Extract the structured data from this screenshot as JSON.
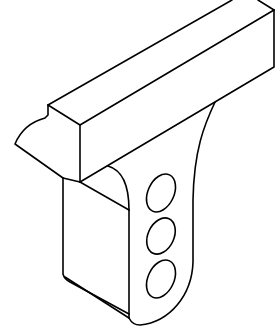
{
  "figure": {
    "title": "Isometric line drawing of a bracket with rectangular bar and three holes",
    "stroke_color": "#000000",
    "background_color": "#ffffff",
    "components": [
      {
        "name": "rectangular-bar",
        "description": "Long rectangular bar running diagonally from lower-left to upper-right"
      },
      {
        "name": "wedge-tip",
        "description": "Curved tapered tip with a small notch at the left end of the bar"
      },
      {
        "name": "vertical-bracket",
        "description": "Vertical plate hanging below the bar with a rounded bottom"
      },
      {
        "name": "holes",
        "description": "Three elliptical holes on the bracket side face",
        "count": 3
      }
    ]
  }
}
